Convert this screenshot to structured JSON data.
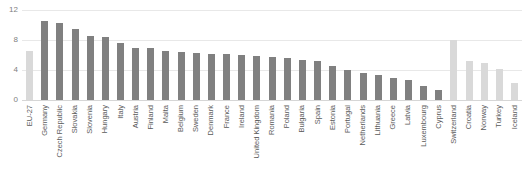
{
  "chart_data": {
    "type": "bar",
    "title": "",
    "xlabel": "",
    "ylabel": "",
    "ylim": [
      0,
      12
    ],
    "yticks": [
      0,
      4,
      8,
      12
    ],
    "grid": true,
    "legend": "none",
    "categories": [
      "EU-27",
      "Germany",
      "Czech Republic",
      "Slovakia",
      "Slovenia",
      "Hungary",
      "Italy",
      "Austria",
      "Finland",
      "Malta",
      "Belgium",
      "Sweden",
      "Denmark",
      "France",
      "Ireland",
      "United Kingdom",
      "Romania",
      "Poland",
      "Bulgaria",
      "Spain",
      "Estonia",
      "Portugal",
      "Netherlands",
      "Lithuania",
      "Greece",
      "Latvia",
      "Luxembourg",
      "Cyprus",
      "Switzerland",
      "Croatia",
      "Norway",
      "Turkey",
      "Iceland"
    ],
    "values": [
      6.5,
      10.6,
      10.3,
      9.5,
      8.6,
      8.4,
      7.6,
      7.0,
      6.9,
      6.5,
      6.4,
      6.3,
      6.2,
      6.1,
      6.0,
      5.9,
      5.8,
      5.6,
      5.4,
      5.2,
      4.5,
      4.0,
      3.6,
      3.4,
      2.9,
      2.7,
      1.9,
      1.3,
      8.0,
      5.2,
      5.0,
      4.2,
      2.3
    ],
    "series_colors": {
      "eu_aggregate": "#d9d9d9",
      "member_state": "#808080",
      "non_eu": "#d9d9d9"
    },
    "bar_styles": [
      "light",
      "dark",
      "dark",
      "dark",
      "dark",
      "dark",
      "dark",
      "dark",
      "dark",
      "dark",
      "dark",
      "dark",
      "dark",
      "dark",
      "dark",
      "dark",
      "dark",
      "dark",
      "dark",
      "dark",
      "dark",
      "dark",
      "dark",
      "dark",
      "dark",
      "dark",
      "dark",
      "dark",
      "light",
      "light",
      "light",
      "light",
      "light"
    ]
  }
}
